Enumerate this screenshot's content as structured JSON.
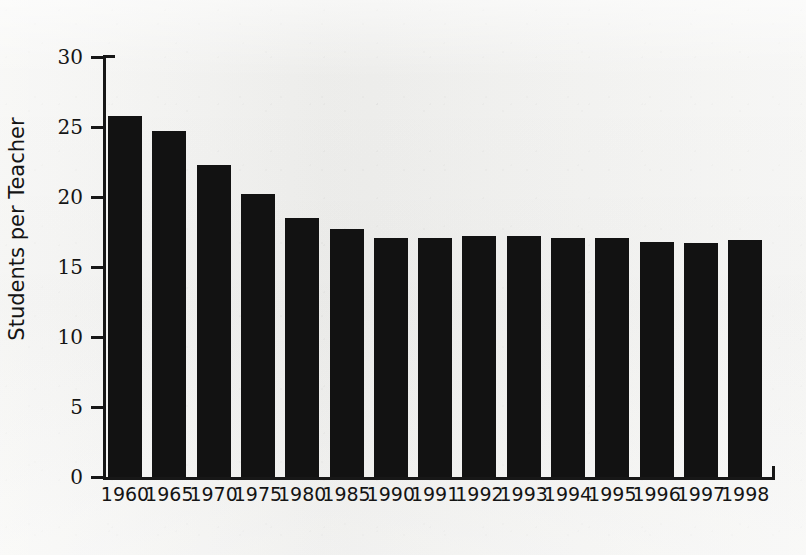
{
  "chart_data": {
    "type": "bar",
    "title": "",
    "xlabel": "",
    "ylabel": "Students per Teacher",
    "categories": [
      "1960",
      "1965",
      "1970",
      "1975",
      "1980",
      "1985",
      "1990",
      "1991",
      "1992",
      "1993",
      "1994",
      "1995",
      "1996",
      "1997",
      "1998"
    ],
    "values": [
      25.8,
      24.7,
      22.3,
      20.2,
      18.5,
      17.7,
      17.1,
      17.1,
      17.2,
      17.2,
      17.1,
      17.1,
      16.8,
      16.7,
      16.9
    ],
    "ylim": [
      0,
      30
    ],
    "yticks": [
      0,
      5,
      10,
      15,
      20,
      25,
      30
    ],
    "ytick_labels": [
      "0",
      "5",
      "10",
      "15",
      "20",
      "25",
      "30"
    ],
    "grid": false,
    "legend": false,
    "bar_color": "#121212",
    "background_color": "#f2f2f0",
    "axis_color": "#171717"
  }
}
